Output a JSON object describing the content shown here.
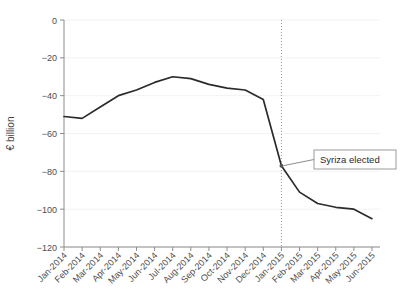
{
  "chart_data": {
    "type": "line",
    "title": "",
    "subtitle": "",
    "xlabel": "",
    "ylabel": "€ billion",
    "ylim": [
      -120,
      0
    ],
    "yticks": [
      0,
      -20,
      -40,
      -60,
      -80,
      -100,
      -120
    ],
    "ytick_labels": [
      "0",
      "−20",
      "−40",
      "−60",
      "−80",
      "−100",
      "−120"
    ],
    "grid": true,
    "grid_axis": "y",
    "legend": null,
    "legend_position": "none",
    "categories": [
      "Jan-2014",
      "Feb-2014",
      "Mar-2014",
      "Apr-2014",
      "May-2014",
      "Jun-2014",
      "Jul-2014",
      "Aug-2014",
      "Sep-2014",
      "Oct-2014",
      "Nov-2014",
      "Dec-2014",
      "Jan-2015",
      "Feb-2015",
      "Mar-2015",
      "Apr-2015",
      "May-2015",
      "Jun-2015"
    ],
    "values": [
      -51,
      -52,
      -46,
      -40,
      -37,
      -33,
      -30,
      -31,
      -34,
      -36,
      -37,
      -42,
      -77,
      -91,
      -97,
      -99,
      -100,
      -105
    ],
    "series": [
      {
        "name": "Target2 balance",
        "color": "#2b2b2b",
        "values": [
          -51,
          -52,
          -46,
          -40,
          -37,
          -33,
          -30,
          -31,
          -34,
          -36,
          -37,
          -42,
          -77,
          -91,
          -97,
          -99,
          -100,
          -105
        ]
      }
    ],
    "annotations": [
      {
        "text": "Syriza elected",
        "point_category": "Jan-2015",
        "point_value": -77,
        "marker": true,
        "vline_category": "Jan-2015",
        "vline_style": "dotted"
      }
    ],
    "colors": {
      "line": "#2b2b2b",
      "grid": "#f2f2f2",
      "axis": "#8c8c8c",
      "text": "#4d4d4d",
      "annotation_box_border": "#9a9a9a",
      "annotation_leader": "#8c8c8c",
      "background": "#ffffff"
    }
  }
}
